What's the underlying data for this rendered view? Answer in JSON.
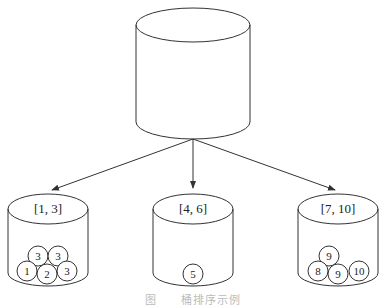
{
  "diagram": {
    "type": "bucket-sort",
    "source_container": {
      "label": ""
    },
    "buckets": [
      {
        "range": "[1, 3]",
        "balls": [
          "3",
          "3",
          "1",
          "2",
          "3"
        ]
      },
      {
        "range": "[4, 6]",
        "balls": [
          "5"
        ]
      },
      {
        "range": "[7, 10]",
        "balls": [
          "9",
          "8",
          "9",
          "10"
        ]
      }
    ],
    "edges": [
      {
        "from": "source",
        "to": "bucket-1"
      },
      {
        "from": "source",
        "to": "bucket-2"
      },
      {
        "from": "source",
        "to": "bucket-3"
      }
    ]
  },
  "caption": "图　　桶排序示例",
  "colors": {
    "stroke": "#333333",
    "background": "#ffffff"
  }
}
